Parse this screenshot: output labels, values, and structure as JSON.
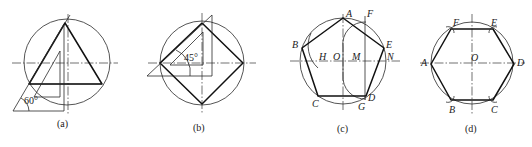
{
  "figure": {
    "panels": [
      {
        "id": "a",
        "caption": "(a)",
        "shape": "inscribed equilateral triangle",
        "tool": "60° set square",
        "angle_label": "60°"
      },
      {
        "id": "b",
        "caption": "(b)",
        "shape": "inscribed square",
        "tool": "45° set square",
        "angle_label": "45°"
      },
      {
        "id": "c",
        "caption": "(c)",
        "shape": "inscribed regular pentagon",
        "labels": {
          "A": "A",
          "B": "B",
          "C": "C",
          "D": "D",
          "E": "E",
          "F": "F",
          "G": "G",
          "H": "H",
          "O": "O",
          "M": "M",
          "N": "N"
        }
      },
      {
        "id": "d",
        "caption": "(d)",
        "shape": "inscribed regular hexagon",
        "labels": {
          "A": "A",
          "B": "B",
          "C": "C",
          "D": "D",
          "E": "E",
          "F": "F",
          "O": "O"
        }
      }
    ]
  },
  "colors": {
    "background": "#ffffff",
    "ink": "#111111"
  }
}
